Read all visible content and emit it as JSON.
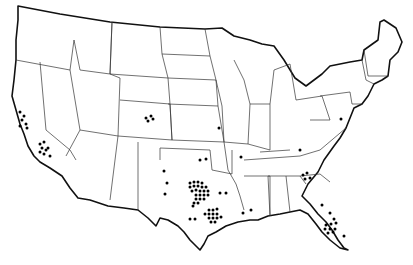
{
  "map": {
    "type": "us-states-outline",
    "background": "#ffffff",
    "stroke_color": "#111111",
    "dot_color": "#000000",
    "dots": [
      [
        20,
        112
      ],
      [
        24,
        116
      ],
      [
        22,
        120
      ],
      [
        26,
        124
      ],
      [
        20,
        126
      ],
      [
        27,
        128
      ],
      [
        40,
        144
      ],
      [
        44,
        142
      ],
      [
        42,
        148
      ],
      [
        46,
        150
      ],
      [
        40,
        152
      ],
      [
        48,
        148
      ],
      [
        44,
        154
      ],
      [
        50,
        156
      ],
      [
        146,
        118
      ],
      [
        151,
        116
      ],
      [
        148,
        121
      ],
      [
        153,
        119
      ],
      [
        219,
        128
      ],
      [
        164,
        171
      ],
      [
        167,
        183
      ],
      [
        165,
        194
      ],
      [
        200,
        160
      ],
      [
        206,
        159
      ],
      [
        241,
        157
      ],
      [
        190,
        183
      ],
      [
        194,
        182
      ],
      [
        198,
        182
      ],
      [
        202,
        183
      ],
      [
        190,
        187
      ],
      [
        194,
        186
      ],
      [
        198,
        186
      ],
      [
        202,
        187
      ],
      [
        206,
        187
      ],
      [
        192,
        191
      ],
      [
        196,
        190
      ],
      [
        200,
        191
      ],
      [
        204,
        191
      ],
      [
        208,
        191
      ],
      [
        196,
        195
      ],
      [
        200,
        195
      ],
      [
        204,
        195
      ],
      [
        208,
        195
      ],
      [
        196,
        199
      ],
      [
        200,
        199
      ],
      [
        204,
        199
      ],
      [
        194,
        203
      ],
      [
        198,
        203
      ],
      [
        193,
        206
      ],
      [
        220,
        193
      ],
      [
        209,
        210
      ],
      [
        213,
        210
      ],
      [
        217,
        209
      ],
      [
        205,
        214
      ],
      [
        209,
        214
      ],
      [
        213,
        214
      ],
      [
        217,
        214
      ],
      [
        209,
        218
      ],
      [
        213,
        218
      ],
      [
        217,
        218
      ],
      [
        221,
        217
      ],
      [
        211,
        222
      ],
      [
        215,
        222
      ],
      [
        190,
        219
      ],
      [
        195,
        219
      ],
      [
        243,
        213
      ],
      [
        251,
        210
      ],
      [
        226,
        193
      ],
      [
        341,
        119
      ],
      [
        300,
        150
      ],
      [
        303,
        175
      ],
      [
        307,
        173
      ],
      [
        305,
        179
      ],
      [
        310,
        178
      ],
      [
        322,
        205
      ],
      [
        330,
        213
      ],
      [
        334,
        219
      ],
      [
        326,
        225
      ],
      [
        331,
        224
      ],
      [
        336,
        223
      ],
      [
        325,
        229
      ],
      [
        330,
        229
      ],
      [
        335,
        229
      ],
      [
        328,
        233
      ],
      [
        333,
        232
      ],
      [
        344,
        236
      ]
    ]
  }
}
